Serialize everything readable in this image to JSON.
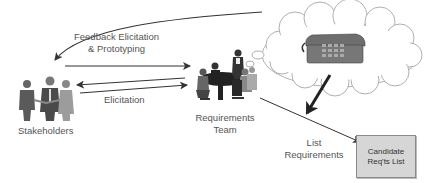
{
  "diagram": {
    "nodes": {
      "stakeholders": {
        "label": "Stakeholders"
      },
      "requirements_team": {
        "label_line1": "Requirements",
        "label_line2": "Team"
      },
      "candidate_list": {
        "label_line1": "Candidate",
        "label_line2": "Req'ts List"
      },
      "idea_cloud": {
        "icon": "telephone-icon"
      }
    },
    "edges": {
      "feedback": {
        "label_line1": "Feedback Elicitation",
        "label_line2": "& Prototyping"
      },
      "elicitation": {
        "label": "Elicitation"
      },
      "list_requirements": {
        "label_line1": "List",
        "label_line2": "Requirements"
      }
    },
    "colors": {
      "arrow": "#333333",
      "text": "#555555",
      "box_fill": "#d6d6d6",
      "cloud_stroke": "#9a9a9a"
    }
  }
}
